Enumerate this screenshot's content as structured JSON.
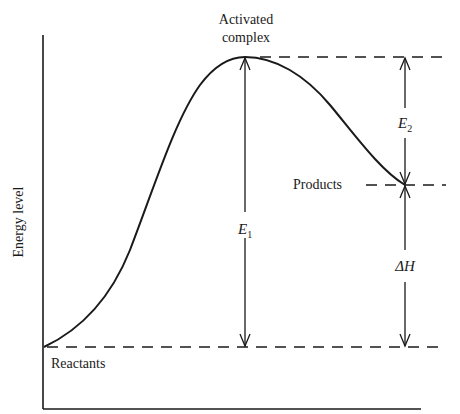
{
  "diagram": {
    "type": "energy-profile",
    "y_axis_label": "Energy level",
    "labels": {
      "activated_line1": "Activated",
      "activated_line2": "complex",
      "products": "Products",
      "reactants": "Reactants",
      "e1": "E",
      "e1_sub": "1",
      "e2": "E",
      "e2_sub": "2",
      "delta_h": "ΔH"
    },
    "colors": {
      "ink": "#1a1a1a",
      "background": "#ffffff"
    },
    "levels": {
      "reactants_y": 347,
      "activated_complex_y": 57,
      "products_y": 185
    }
  }
}
